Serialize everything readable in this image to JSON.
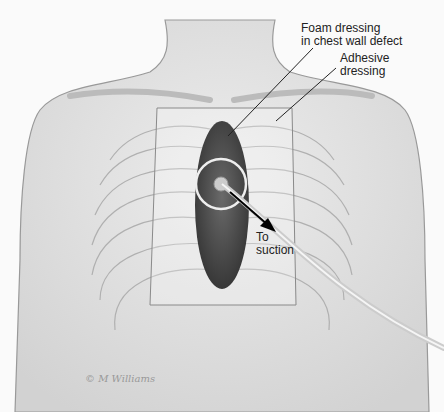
{
  "figure": {
    "type": "medical-illustration",
    "labels": {
      "foam": [
        "Foam dressing",
        "in chest wall defect"
      ],
      "adhesive": [
        "Adhesive",
        "dressing"
      ],
      "suction": [
        "To",
        "suction"
      ]
    },
    "signature": "© M Williams",
    "colors": {
      "background": "#fafafa",
      "skin": "#e6e6e6",
      "foam": "#4a4a4a",
      "outline": "#888888",
      "text": "#222222"
    }
  }
}
